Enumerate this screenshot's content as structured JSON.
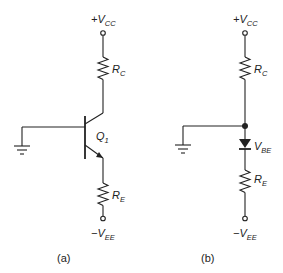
{
  "figure": {
    "panels": [
      {
        "id": "a",
        "caption": "(a)",
        "supply_top": {
          "sign": "+",
          "symbol": "V",
          "subscript": "CC"
        },
        "resistor_top": {
          "symbol": "R",
          "subscript": "C"
        },
        "transistor": {
          "symbol": "Q",
          "subscript": "1",
          "type": "NPN"
        },
        "resistor_bottom": {
          "symbol": "R",
          "subscript": "E"
        },
        "supply_bottom": {
          "sign": "−",
          "symbol": "V",
          "subscript": "EE"
        },
        "ground": "ground-symbol"
      },
      {
        "id": "b",
        "caption": "(b)",
        "supply_top": {
          "sign": "+",
          "symbol": "V",
          "subscript": "CC"
        },
        "resistor_top": {
          "symbol": "R",
          "subscript": "C"
        },
        "diode": {
          "symbol": "V",
          "subscript": "BE"
        },
        "resistor_bottom": {
          "symbol": "R",
          "subscript": "E"
        },
        "supply_bottom": {
          "sign": "−",
          "symbol": "V",
          "subscript": "EE"
        },
        "ground": "ground-symbol"
      }
    ]
  }
}
